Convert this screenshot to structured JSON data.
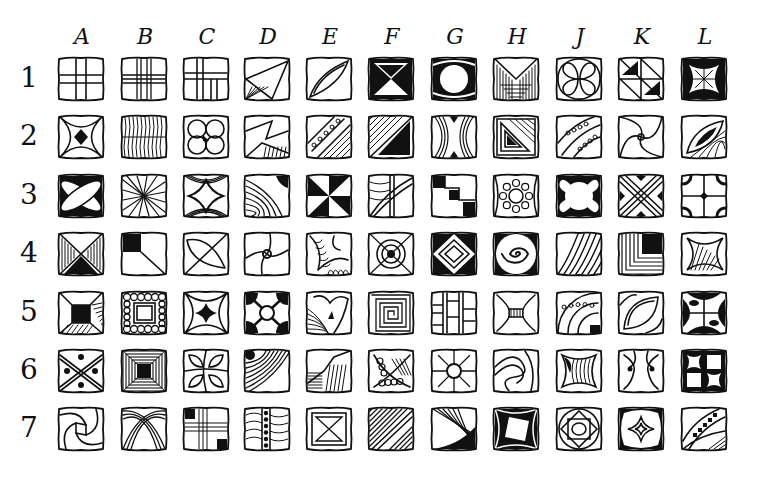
{
  "grid": {
    "columns": [
      "A",
      "B",
      "C",
      "D",
      "E",
      "F",
      "G",
      "H",
      "J",
      "K",
      "L"
    ],
    "rows": [
      "1",
      "2",
      "3",
      "4",
      "5",
      "6",
      "7"
    ],
    "ink_color": "#111111",
    "paper_color": "#ffffff"
  },
  "tiles": [
    [
      "grid-cross",
      "lined-cross",
      "offset-cross",
      "diamond-fan",
      "lens-diamond",
      "hourglass-black",
      "circle-frame",
      "v-stripes",
      "interlocking-rings",
      "triangle-hatch",
      "star-burst"
    ],
    [
      "curved-star",
      "wavy-ribbed",
      "four-balls",
      "folded-ribbon",
      "beaded-diagonal",
      "diagonal-black-triangle",
      "crescent-pillars",
      "nested-triangle",
      "beaded-arcs",
      "swirl-pinwheel",
      "leaf-eye"
    ],
    [
      "crossed-ovals",
      "radiating-curves",
      "concave-diamond",
      "concentric-arcs",
      "pinwheel",
      "crossed-bands",
      "step-stair",
      "dotted-rosette",
      "four-petal",
      "x-lattice",
      "quad-arcs-dot"
    ],
    [
      "bowtie-hatch",
      "corner-square",
      "diagonal-lens",
      "spiral-pinwheel",
      "leaf-curl",
      "target-rings",
      "nested-diamonds",
      "spiral",
      "diagonal-stripes",
      "corner-frame",
      "concave-hatch"
    ],
    [
      "frame-hatch",
      "bead-border",
      "concave-star",
      "quarter-circles",
      "heart-curl",
      "square-spiral",
      "brick-lines",
      "waisted-pillar",
      "dotted-arc-bands",
      "pod-lens",
      "eye-quad"
    ],
    [
      "dotted-x",
      "deep-frame",
      "leaf-quad",
      "stripe-diagonal",
      "staircase-hatch",
      "dot-fill-diagonal",
      "spoke-ring",
      "s-wave",
      "concave-lines",
      "scroll-motif",
      "checker-concave"
    ],
    [
      "swirl-pinwheel-2",
      "crossed-arches",
      "corner-steps",
      "beaded-column",
      "nested-x-frame",
      "diagonal-bands",
      "arc-sweep",
      "tilted-square",
      "nested-rose",
      "star-web",
      "checker-arc"
    ]
  ]
}
